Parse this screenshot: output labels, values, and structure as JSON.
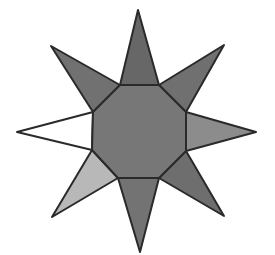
{
  "figure": {
    "stroke_color": "#2a2a2a",
    "octagon": {
      "points": "120,85 159,85 186,112 186,151 159,178 118,178 92,150 93,112",
      "fill": "#777777"
    },
    "rays": [
      {
        "name": "top",
        "points": "120,85 138,10 159,85",
        "fill": "#676767"
      },
      {
        "name": "top-right",
        "points": "159,85 224,45 186,112",
        "fill": "#707070"
      },
      {
        "name": "right",
        "points": "186,112 256,132 186,151",
        "fill": "#8c8c8c"
      },
      {
        "name": "bottom-right",
        "points": "186,151 224,216 159,178",
        "fill": "#6e6e6e"
      },
      {
        "name": "bottom",
        "points": "159,178 140,252 118,178",
        "fill": "#737373"
      },
      {
        "name": "bottom-left",
        "points": "118,178 52,217 92,150",
        "fill": "#b8b8b8"
      },
      {
        "name": "left",
        "points": "92,150 17,132 93,112",
        "fill": "#ffffff"
      },
      {
        "name": "top-left",
        "points": "93,112 51,46 120,85",
        "fill": "#717171"
      }
    ]
  }
}
